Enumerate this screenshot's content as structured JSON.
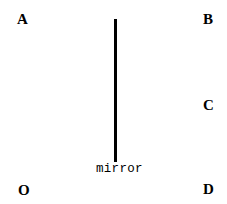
{
  "diagram": {
    "background": "#ffffff",
    "points": [
      {
        "label": "A",
        "x": 17,
        "y": 12
      },
      {
        "label": "B",
        "x": 203,
        "y": 12
      },
      {
        "label": "C",
        "x": 203,
        "y": 98
      },
      {
        "label": "O",
        "x": 18,
        "y": 183
      },
      {
        "label": "D",
        "x": 203,
        "y": 182
      }
    ],
    "mirror": {
      "label": "mirror",
      "x": 114,
      "y_top": 19,
      "y_bottom": 162,
      "thickness": 3,
      "color": "#000000"
    }
  }
}
